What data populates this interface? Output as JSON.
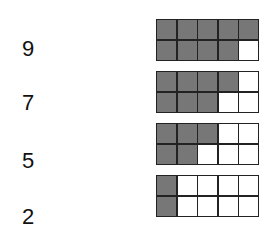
{
  "rows": [
    {
      "number": "9",
      "filled": 9
    },
    {
      "number": "7",
      "filled": 7
    },
    {
      "number": "5",
      "filled": 5
    },
    {
      "number": "2",
      "filled": 2
    }
  ],
  "frame": {
    "rows": 2,
    "cols": 5,
    "fill_color": "#777777",
    "empty_color": "#ffffff",
    "fill_order": "column-wise top then bottom"
  }
}
